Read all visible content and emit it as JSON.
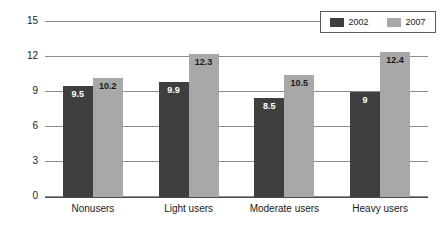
{
  "chart_data": {
    "type": "bar",
    "title": "",
    "subtitle": "",
    "xlabel": "",
    "ylabel": "",
    "categories": [
      "Nonusers",
      "Light users",
      "Moderate users",
      "Heavy users"
    ],
    "series": [
      {
        "name": "2002",
        "color": "#3f3f3f",
        "values": [
          9.5,
          9.9,
          8.5,
          9
        ],
        "labels": [
          "9.5",
          "9.9",
          "8.5",
          "9"
        ]
      },
      {
        "name": "2007",
        "color": "#a8a8a8",
        "values": [
          10.2,
          12.3,
          10.5,
          12.4
        ],
        "labels": [
          "10.2",
          "12.3",
          "10.5",
          "12.4"
        ]
      }
    ],
    "ylim": [
      0,
      15
    ],
    "yticks": [
      0,
      3,
      6,
      9,
      12,
      15
    ],
    "ytick_labels": [
      "0",
      "3",
      "6",
      "9",
      "12",
      "15"
    ],
    "grid": true,
    "legend_position": "top-right",
    "legend_entries": [
      "2002",
      "2007"
    ]
  },
  "colors": {
    "series_2002": "#3f3f3f",
    "series_2007": "#a8a8a8",
    "gridline": "#8d8d8d",
    "axis": "#4a4a4a",
    "background": "#ffffff",
    "text": "#1a1a1a"
  }
}
